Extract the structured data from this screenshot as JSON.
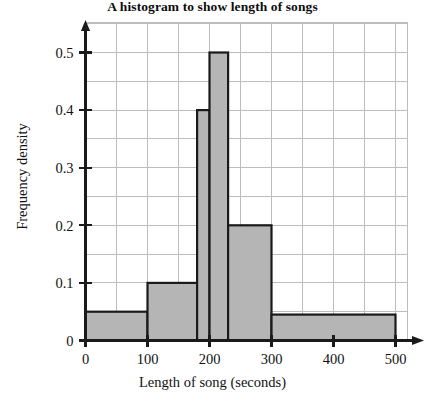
{
  "chart_data": {
    "type": "bar",
    "title": "A histogram to show length of songs",
    "xlabel": "Length of song (seconds)",
    "ylabel": "Frequency density",
    "xlim": [
      0,
      520
    ],
    "ylim": [
      0,
      0.55
    ],
    "grid": true,
    "grid_x_step": 50,
    "grid_y_step": 0.05,
    "xticks": [
      0,
      100,
      200,
      300,
      400,
      500
    ],
    "xtick_labels": [
      "0",
      "100",
      "200",
      "300",
      "400",
      "500"
    ],
    "yticks": [
      0,
      0.1,
      0.2,
      0.3,
      0.4,
      0.5
    ],
    "ytick_labels": [
      "0",
      "0.1",
      "0.2",
      "0.3",
      "0.4",
      "0.5"
    ],
    "legend": null,
    "bar_fill_color": "#b5b5b5",
    "bar_edge_color": "#1a1a1a",
    "grid_color": "#bdbdbd",
    "axis_color": "#1a1a1a",
    "bins": [
      {
        "start": 0,
        "end": 100,
        "density": 0.05
      },
      {
        "start": 100,
        "end": 180,
        "density": 0.1
      },
      {
        "start": 180,
        "end": 200,
        "density": 0.4
      },
      {
        "start": 200,
        "end": 230,
        "density": 0.5
      },
      {
        "start": 230,
        "end": 300,
        "density": 0.2
      },
      {
        "start": 300,
        "end": 500,
        "density": 0.045
      }
    ]
  }
}
